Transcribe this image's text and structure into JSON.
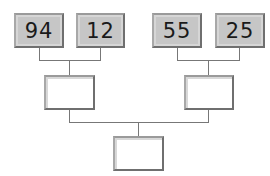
{
  "diagram": {
    "type": "tournament-bracket",
    "leaves": [
      {
        "value": "94"
      },
      {
        "value": "12"
      },
      {
        "value": "55"
      },
      {
        "value": "25"
      }
    ],
    "middle": [
      {
        "value": ""
      },
      {
        "value": ""
      }
    ],
    "root": {
      "value": ""
    },
    "colors": {
      "filled_box": "#c6c6c6",
      "border": "#6f6f6f",
      "line": "#777777"
    }
  }
}
